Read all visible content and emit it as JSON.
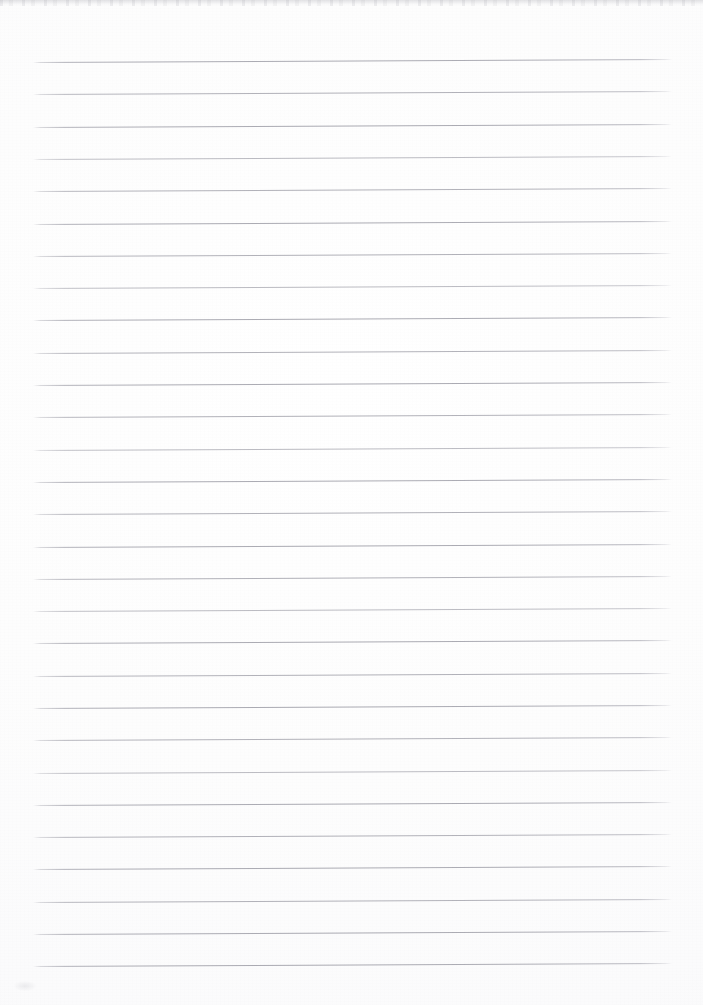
{
  "document": {
    "kind": "scanned-lined-paper",
    "title": "Blank ruled notebook page",
    "page_width": 703,
    "page_height": 1005,
    "paper_color": "#fdfdfd",
    "rule_color": "#b0b0b8",
    "written_text": "",
    "handwriting_present": "no",
    "visible_text_items": []
  },
  "ruling": {
    "style": "wide-ruled horizontal lines",
    "line_count": 29,
    "line_spacing_px": 32.3,
    "first_line_y": 62,
    "last_line_y": 966,
    "line_left_x": 33,
    "line_right_x": 672,
    "line_thickness_px": 1,
    "slant_degrees": -0.27,
    "margin_rule_present": "no",
    "holes_present": "no"
  },
  "artifacts": {
    "top_edge_band": "faint grey speckle strip along the top edge",
    "bottom_left_smudge": "small faint grey mark near lower-left corner",
    "grain": "light scanner grain across the sheet"
  },
  "lines": [
    {
      "index": 1,
      "y": 62,
      "tone": "tone-dark"
    },
    {
      "index": 2,
      "y": 94,
      "tone": "tone-mid"
    },
    {
      "index": 3,
      "y": 127,
      "tone": "tone-dark"
    },
    {
      "index": 4,
      "y": 159,
      "tone": "tone-light"
    },
    {
      "index": 5,
      "y": 191,
      "tone": "tone-mid"
    },
    {
      "index": 6,
      "y": 224,
      "tone": "tone-dark"
    },
    {
      "index": 7,
      "y": 256,
      "tone": "tone-mid"
    },
    {
      "index": 8,
      "y": 288,
      "tone": "tone-light"
    },
    {
      "index": 9,
      "y": 320,
      "tone": "tone-dark"
    },
    {
      "index": 10,
      "y": 353,
      "tone": "tone-mid"
    },
    {
      "index": 11,
      "y": 385,
      "tone": "tone-dark"
    },
    {
      "index": 12,
      "y": 417,
      "tone": "tone-mid"
    },
    {
      "index": 13,
      "y": 450,
      "tone": "tone-light"
    },
    {
      "index": 14,
      "y": 482,
      "tone": "tone-dark"
    },
    {
      "index": 15,
      "y": 514,
      "tone": "tone-mid"
    },
    {
      "index": 16,
      "y": 547,
      "tone": "tone-dark"
    },
    {
      "index": 17,
      "y": 579,
      "tone": "tone-mid"
    },
    {
      "index": 18,
      "y": 611,
      "tone": "tone-light"
    },
    {
      "index": 19,
      "y": 643,
      "tone": "tone-dark"
    },
    {
      "index": 20,
      "y": 676,
      "tone": "tone-mid"
    },
    {
      "index": 21,
      "y": 708,
      "tone": "tone-dark"
    },
    {
      "index": 22,
      "y": 740,
      "tone": "tone-mid"
    },
    {
      "index": 23,
      "y": 773,
      "tone": "tone-light"
    },
    {
      "index": 24,
      "y": 805,
      "tone": "tone-dark"
    },
    {
      "index": 25,
      "y": 837,
      "tone": "tone-mid"
    },
    {
      "index": 26,
      "y": 869,
      "tone": "tone-dark"
    },
    {
      "index": 27,
      "y": 902,
      "tone": "tone-mid"
    },
    {
      "index": 28,
      "y": 934,
      "tone": "tone-dark"
    },
    {
      "index": 29,
      "y": 966,
      "tone": "tone-dark"
    }
  ]
}
